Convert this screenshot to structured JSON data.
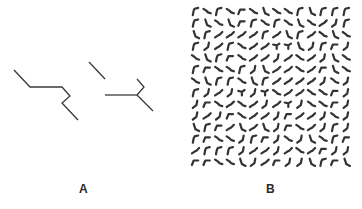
{
  "figure": {
    "panels": [
      {
        "id": "A",
        "label": "A",
        "stroke_color": "#3a3a3a",
        "shapes": [
          {
            "name": "zigzag-line",
            "points": [
              [
                14,
                70
              ],
              [
                30,
                87
              ],
              [
                62,
                87
              ],
              [
                70,
                96
              ],
              [
                62,
                103
              ],
              [
                78,
                120
              ]
            ]
          },
          {
            "name": "diagonal-segment",
            "points": [
              [
                89,
                62
              ],
              [
                105,
                79
              ]
            ]
          },
          {
            "name": "horizontal-stem",
            "points": [
              [
                105,
                95
              ],
              [
                137,
                95
              ]
            ]
          },
          {
            "name": "upper-hook",
            "points": [
              [
                137,
                95
              ],
              [
                144,
                87
              ],
              [
                137,
                79
              ]
            ]
          },
          {
            "name": "lower-branch",
            "points": [
              [
                137,
                95
              ],
              [
                153,
                111
              ]
            ]
          }
        ]
      },
      {
        "id": "B",
        "label": "B",
        "stroke_color": "#333333",
        "grid": {
          "origin": [
            10,
            7
          ],
          "spacing": 11.6,
          "cell_size": 9,
          "rows": [
            "fsfsrslssflfff",
            "flslrfsfslsejf",
            "lfeeeefelfesls",
            "fjefseettljfrj",
            "slfrseejesejls",
            "frssfjleeserls",
            "slffslfeeeejsj",
            "fjejtjtseessrj",
            "jrsesejetjssrj",
            "jejrseejreejsj",
            "lfreleljrsejfje",
            "frssjfrjsjlsfr",
            "efffjeejeserjj",
            "rrssljerjjlfrl"
          ]
        }
      }
    ],
    "glyph_variants": {
      "f": "M2,9 L3,4 L4,2 L8,1",
      "s": "M1,2 L4,4 L6,6 L9,7",
      "l": "M3,1 L5,7 L9,9",
      "r": "M1,8 L3,3 L8,3",
      "e": "M1,8 L4,6 L6,5 L9,2",
      "j": "M7,1 L6,6 L2,9",
      "t": "M1,3 L5,4 L8,2 M5,4 L5,8"
    }
  }
}
